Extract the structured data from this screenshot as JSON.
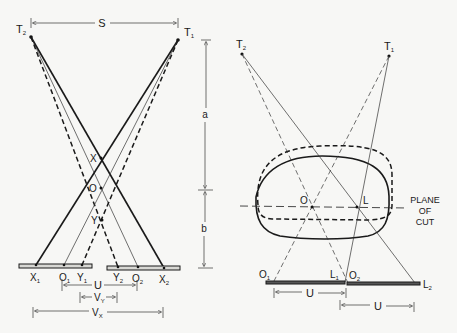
{
  "figure": {
    "left_diagram": {
      "tubes": {
        "t2": "T",
        "t2_sub": "2",
        "t1": "T",
        "t1_sub": "1"
      },
      "separation_label": "S",
      "points": {
        "x": "X",
        "o": "O",
        "y": "Y"
      },
      "film_points": {
        "x1": "X",
        "x1_sub": "1",
        "o1": "O",
        "o1_sub": "1",
        "y1": "Y",
        "y1_sub": "1",
        "y2": "Y",
        "y2_sub": "2",
        "o2": "O",
        "o2_sub": "2",
        "x2": "X",
        "x2_sub": "2"
      },
      "vertical_dims": {
        "a": "a",
        "b": "b"
      },
      "horizontal_dims": {
        "u": "U",
        "vy": "V",
        "vy_sub": "Y",
        "vx": "V",
        "vx_sub": "X"
      }
    },
    "right_diagram": {
      "tubes": {
        "t2": "T",
        "t2_sub": "2",
        "t1": "T",
        "t1_sub": "1"
      },
      "points": {
        "o": "O",
        "l": "L"
      },
      "plane_label": {
        "line1": "PLANE",
        "line2": "OF",
        "line3": "CUT"
      },
      "film_points": {
        "o1": "O",
        "o1_sub": "1",
        "l1": "L",
        "l1_sub": "1",
        "o2": "O",
        "o2_sub": "2",
        "l2": "L",
        "l2_sub": "2"
      },
      "dims": {
        "u1": "U",
        "u2": "U"
      }
    }
  }
}
